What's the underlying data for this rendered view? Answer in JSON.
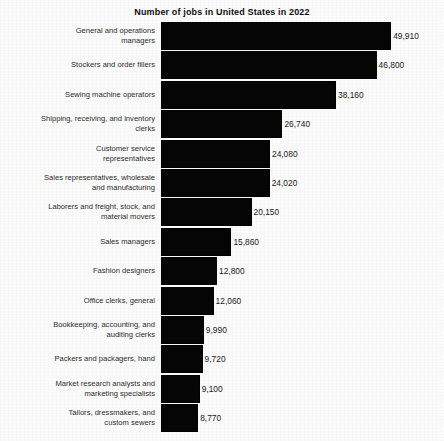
{
  "chart_data": {
    "type": "bar",
    "orientation": "horizontal",
    "title": "Number of jobs in United States in 2022",
    "xlabel": "",
    "ylabel": "",
    "grid": false,
    "legend": false,
    "xlim": [
      0,
      52000
    ],
    "categories": [
      "General and operations managers",
      "Stockers and order fillers",
      "Sewing machine operators",
      "Shipping, receiving, and inventory clerks",
      "Customer service representatives",
      "Sales representatives, wholesale and manufacturing",
      "Laborers and freight, stock, and material movers",
      "Sales managers",
      "Fashion designers",
      "Office clerks, general",
      "Bookkeeping, accounting, and auditing clerks",
      "Packers and packagers, hand",
      "Market research analysts and marketing specialists",
      "Tailors, dressmakers, and custom sewers"
    ],
    "values": [
      49910,
      46800,
      38160,
      26740,
      24080,
      24020,
      20150,
      15860,
      12800,
      12060,
      9990,
      9720,
      9100,
      8770
    ],
    "value_labels": [
      "49,910",
      "46,800",
      "38,160",
      "26,740",
      "24,080",
      "24,020",
      "20,150",
      "15,860",
      "12,800",
      "12,060",
      "9,990",
      "9,720",
      "9,100",
      "8,770"
    ],
    "bar_color": "#050505",
    "background_color": "#fbfbfb"
  },
  "rows": [
    {
      "label_lines": [
        "General and operations",
        "managers"
      ],
      "value_label": "49,910",
      "value": 49910
    },
    {
      "label_lines": [
        "Stockers and order fillers"
      ],
      "value_label": "46,800",
      "value": 46800
    },
    {
      "label_lines": [
        "Sewing machine operators"
      ],
      "value_label": "38,160",
      "value": 38160
    },
    {
      "label_lines": [
        "Shipping, receiving, and inventory",
        "clerks"
      ],
      "value_label": "26,740",
      "value": 26740
    },
    {
      "label_lines": [
        "Customer service",
        "representatives"
      ],
      "value_label": "24,080",
      "value": 24080
    },
    {
      "label_lines": [
        "Sales representatives, wholesale",
        "and manufacturing"
      ],
      "value_label": "24,020",
      "value": 24020
    },
    {
      "label_lines": [
        "Laborers and freight, stock, and",
        "material movers"
      ],
      "value_label": "20,150",
      "value": 20150
    },
    {
      "label_lines": [
        "Sales managers"
      ],
      "value_label": "15,860",
      "value": 15860
    },
    {
      "label_lines": [
        "Fashion designers"
      ],
      "value_label": "12,800",
      "value": 12800
    },
    {
      "label_lines": [
        "Office clerks, general"
      ],
      "value_label": "12,060",
      "value": 12060
    },
    {
      "label_lines": [
        "Bookkeeping, accounting, and",
        "auditing clerks"
      ],
      "value_label": "9,990",
      "value": 9990
    },
    {
      "label_lines": [
        "Packers and packagers, hand"
      ],
      "value_label": "9,720",
      "value": 9720
    },
    {
      "label_lines": [
        "Market research analysts and",
        "marketing specialists"
      ],
      "value_label": "9,100",
      "value": 9100
    },
    {
      "label_lines": [
        "Tailors, dressmakers, and",
        "custom sewers"
      ],
      "value_label": "8,770",
      "value": 8770
    }
  ]
}
